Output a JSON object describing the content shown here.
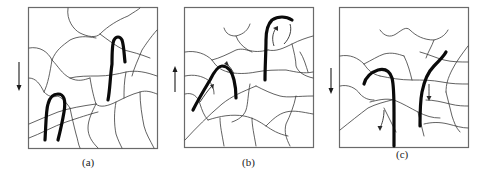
{
  "figure": {
    "panels": [
      {
        "id": "a",
        "label": "(a)",
        "force_direction": "down",
        "description": "Polymer network with two hairpin-folded thick chains"
      },
      {
        "id": "b",
        "label": "(b)",
        "force_direction": "up",
        "description": "Chains pulled upward, sliding along their contours (small arrows)"
      },
      {
        "id": "c",
        "label": "(c)",
        "force_direction": "down",
        "description": "Chains pulled downward, sliding out of the network (small arrows)"
      }
    ],
    "colors": {
      "frame": "#6a6a6a",
      "network": "#3a3a3a",
      "chain": "#0a0a0a",
      "background": "#ffffff"
    }
  }
}
